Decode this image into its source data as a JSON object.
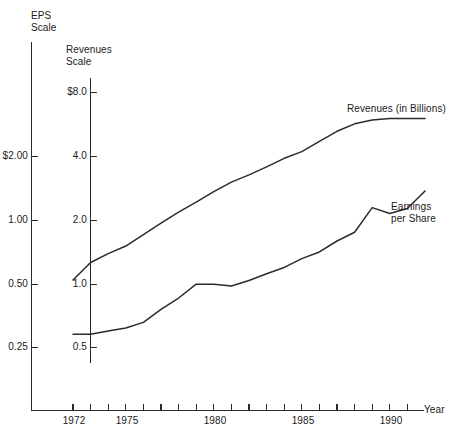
{
  "chart_data": {
    "type": "line",
    "title": "",
    "xlabel": "Year",
    "grid": false,
    "legend_position": "inline-right",
    "annotations": [
      {
        "text": "EPS\nScale",
        "for": "eps-axis"
      },
      {
        "text": "Revenues\nScale",
        "for": "revenue-axis"
      },
      {
        "text": "Revenues (in Billions)",
        "for": "revenues-series"
      },
      {
        "text": "Earnings\nper Share",
        "for": "eps-series"
      }
    ],
    "x": [
      1972,
      1973,
      1974,
      1975,
      1976,
      1977,
      1978,
      1979,
      1980,
      1981,
      1982,
      1983,
      1984,
      1985,
      1986,
      1987,
      1988,
      1989,
      1990,
      1991,
      1992
    ],
    "x_axis": {
      "label": "Year",
      "tick_labels": [
        "1972",
        "1975",
        "1980",
        "1985",
        "1990"
      ],
      "tick_label_years": [
        1972,
        1975,
        1980,
        1985,
        1990
      ],
      "tick_years": [
        1972,
        1973,
        1974,
        1975,
        1976,
        1977,
        1978,
        1979,
        1980,
        1981,
        1982,
        1983,
        1984,
        1985,
        1986,
        1987,
        1988,
        1989,
        1990,
        1991,
        1992
      ],
      "range": [
        1971,
        1992.5
      ]
    },
    "axes": [
      {
        "id": "eps-axis",
        "name": "EPS Scale",
        "scale": "log2",
        "tick_labels": [
          "$2.00",
          "1.00",
          "0.50",
          "0.25"
        ],
        "tick_values": [
          2.0,
          1.0,
          0.5,
          0.25
        ],
        "range": [
          0.19,
          3.2
        ]
      },
      {
        "id": "revenue-axis",
        "name": "Revenues Scale",
        "scale": "log2",
        "tick_labels": [
          "$8.0",
          "4.0",
          "2.0",
          "1.0",
          "0.5"
        ],
        "tick_values": [
          8.0,
          4.0,
          2.0,
          1.0,
          0.5
        ],
        "range": [
          0.42,
          11.0
        ]
      }
    ],
    "series": [
      {
        "name": "Revenues (in Billions)",
        "axis": "revenue-axis",
        "unit": "billions of dollars",
        "color": "#2b2b2b",
        "values": [
          1.05,
          1.27,
          1.4,
          1.52,
          1.72,
          1.95,
          2.2,
          2.45,
          2.75,
          3.05,
          3.3,
          3.6,
          3.95,
          4.25,
          4.75,
          5.3,
          5.75,
          6.0,
          6.1,
          6.1,
          6.1
        ]
      },
      {
        "name": "Earnings per Share",
        "axis": "eps-axis",
        "unit": "dollars per share",
        "color": "#2b2b2b",
        "values": [
          0.29,
          0.29,
          0.3,
          0.31,
          0.33,
          0.38,
          0.43,
          0.5,
          0.5,
          0.49,
          0.52,
          0.56,
          0.6,
          0.66,
          0.71,
          0.8,
          0.88,
          1.15,
          1.08,
          1.14,
          1.38
        ]
      }
    ]
  },
  "labels": {
    "eps_scale_line1": "EPS",
    "eps_scale_line2": "Scale",
    "revenue_scale_line1": "Revenues",
    "revenue_scale_line2": "Scale",
    "revenues_series": "Revenues (in Billions)",
    "eps_series_line1": "Earnings",
    "eps_series_line2": "per Share",
    "year_axis": "Year",
    "eps_ticks": [
      "$2.00",
      "1.00",
      "0.50",
      "0.25"
    ],
    "revenue_ticks": [
      "$8.0",
      "4.0",
      "2.0",
      "1.0",
      "0.5"
    ],
    "year_ticks": [
      "1972",
      "1975",
      "1980",
      "1985",
      "1990"
    ]
  },
  "colors": {
    "ink": "#2b2b2b",
    "background": "#ffffff"
  }
}
